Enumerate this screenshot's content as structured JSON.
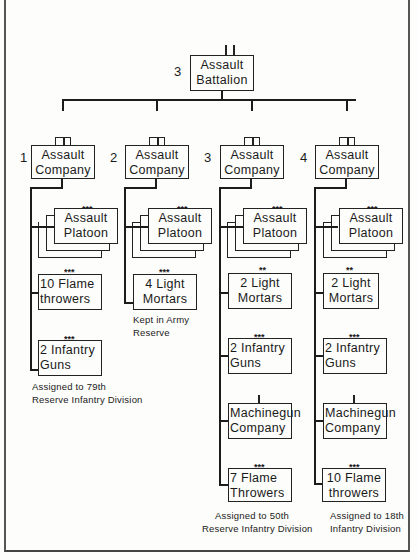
{
  "battalion": {
    "number": "3",
    "line1": "Assault",
    "line2": "Battalion"
  },
  "companies": [
    {
      "number": "1",
      "line1": "Assault",
      "line2": "Company",
      "units": [
        {
          "stars": "***",
          "line1": "Assault",
          "line2": "Platoon",
          "stacked": true
        },
        {
          "stars": "***",
          "line1": "10 Flame",
          "line2": "throwers"
        },
        {
          "stars": "***",
          "line1": "2  Infantry",
          "line2": "Guns"
        }
      ],
      "note": [
        "Assigned to 79th",
        "Reserve Infantry Division"
      ]
    },
    {
      "number": "2",
      "line1": "Assault",
      "line2": "Company",
      "units": [
        {
          "stars": "***",
          "line1": "Assault",
          "line2": "Platoon",
          "stacked": true
        },
        {
          "stars": "***",
          "line1": "4  Light",
          "line2": "Mortars"
        }
      ],
      "note": [
        "Kept in Army",
        "Reserve"
      ]
    },
    {
      "number": "3",
      "line1": "Assault",
      "line2": "Company",
      "units": [
        {
          "stars": "***",
          "line1": "Assault",
          "line2": "Platoon",
          "stacked": true
        },
        {
          "stars": "**",
          "line1": "2  Light",
          "line2": "Mortars"
        },
        {
          "stars": "***",
          "line1": "2  Infantry",
          "line2": "Guns"
        },
        {
          "stars": "|",
          "line1": "Machinegun",
          "line2": "Company"
        },
        {
          "stars": "***",
          "line1": "7 Flame",
          "line2": "Throwers"
        }
      ],
      "note": [
        "Assigned to 50th",
        "Reserve Infantry Division"
      ]
    },
    {
      "number": "4",
      "line1": "Assault",
      "line2": "Company",
      "units": [
        {
          "stars": "***",
          "line1": "Assault",
          "line2": "Platoon",
          "stacked": true
        },
        {
          "stars": "**",
          "line1": "2  Light",
          "line2": "Mortars"
        },
        {
          "stars": "***",
          "line1": "2  Infantry",
          "line2": "Guns"
        },
        {
          "stars": "|",
          "line1": "Machinegun",
          "line2": "Company"
        },
        {
          "stars": "***",
          "line1": "10 Flame",
          "line2": "throwers"
        }
      ],
      "note": [
        "Assigned to 18th",
        "Infantry  Division"
      ]
    }
  ]
}
